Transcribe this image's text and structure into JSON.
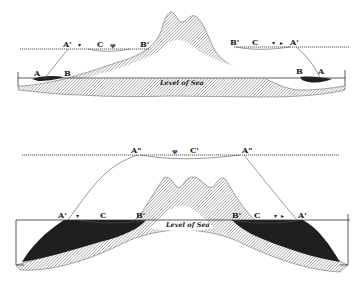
{
  "figure": {
    "type": "geological cross-section diagram",
    "top_section": {
      "sea_level_label": "Level of Sea",
      "left_labels": [
        "A",
        "B",
        "A'",
        "C",
        "B'"
      ],
      "right_labels": [
        "B'",
        "C",
        "A'",
        "B",
        "A"
      ]
    },
    "bottom_section": {
      "sea_level_label": "Level of Sea",
      "upper_labels": [
        "A\"",
        "C'",
        "A\""
      ],
      "left_labels": [
        "A'",
        "C",
        "B'"
      ],
      "right_labels": [
        "B'",
        "C",
        "A'"
      ]
    },
    "colors": {
      "ink": "#222222",
      "hatch": "#777777",
      "deposit": "#1e1e1e",
      "background": "#ffffff"
    }
  }
}
